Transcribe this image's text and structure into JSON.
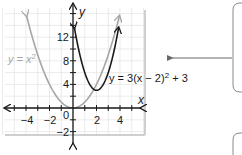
{
  "chart_data": {
    "type": "line",
    "title": "",
    "xlabel": "x",
    "ylabel": "y",
    "xlim": [
      -5.5,
      5.5
    ],
    "ylim": [
      -3.5,
      16
    ],
    "grid": true,
    "x_ticks": [
      -4,
      -2,
      2,
      4
    ],
    "y_ticks": [
      -2,
      4,
      8,
      12
    ],
    "origin_label": "0",
    "series": [
      {
        "name": "y = x²",
        "equation": "y = x^2",
        "color": "#a6a6a6",
        "x": [
          -4,
          -3,
          -2,
          -1,
          0,
          1,
          2,
          3,
          4
        ],
        "y": [
          16,
          9,
          4,
          1,
          0,
          1,
          4,
          9,
          16
        ]
      },
      {
        "name": "y = 3(x − 2)² + 3",
        "equation": "y = 3(x - 2)^2 + 3",
        "color": "#1a1a1a",
        "vertex": [
          2,
          3
        ],
        "x": [
          0,
          0.5,
          1,
          1.5,
          2,
          2.5,
          3,
          3.5,
          4
        ],
        "y": [
          15,
          9.75,
          6,
          3.75,
          3,
          3.75,
          6,
          9.75,
          15
        ]
      }
    ],
    "annotations": [
      {
        "text": "y = x",
        "sup": "2",
        "target": "y = x²"
      },
      {
        "text": "y = 3(x − 2)",
        "sup": "2",
        "tail": " + 3",
        "target": "y = 3(x − 2)² + 3"
      }
    ]
  },
  "labels": {
    "x_axis": "x",
    "y_axis": "y",
    "origin": "0",
    "xt_m4": "−4",
    "xt_m2": "−2",
    "xt_2": "2",
    "xt_4": "4",
    "yt_12": "12",
    "yt_8": "8",
    "yt_4": "4",
    "yt_m2": "−2",
    "eq1_main": "y = x",
    "eq1_sup": "2",
    "eq2_main": "y = 3(x − 2)",
    "eq2_sup": "2",
    "eq2_tail": " + 3"
  },
  "colors": {
    "grid": "#e6e6e6",
    "panel_border": "#cfcfcf",
    "axis": "#1a1a1a",
    "parent_curve": "#a6a6a6",
    "transformed_curve": "#1a1a1a",
    "callout_border": "#9a9a9a"
  }
}
